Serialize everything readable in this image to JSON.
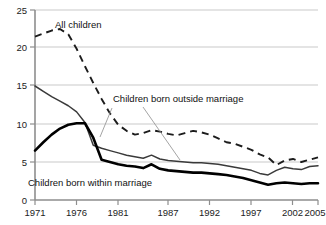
{
  "chart_data": {
    "type": "line",
    "title": "",
    "xlabel": "",
    "ylabel": "",
    "xlim": [
      1971,
      2005
    ],
    "ylim": [
      0,
      25
    ],
    "grid": true,
    "legend_position": "inline-annotations",
    "y_ticks": [
      "0",
      "5",
      "10",
      "15",
      "20",
      "25"
    ],
    "y_tick_values": [
      0,
      5,
      10,
      15,
      20,
      25
    ],
    "x_ticks": [
      "1971",
      "1976",
      "1981",
      "1987",
      "1992",
      "1997",
      "2002",
      "2005"
    ],
    "x_tick_values": [
      1971,
      1976,
      1981,
      1987,
      1992,
      1997,
      2002,
      2005
    ],
    "x": [
      1971,
      1972,
      1973,
      1974,
      1975,
      1976,
      1977,
      1978,
      1979,
      1980,
      1981,
      1982,
      1983,
      1984,
      1985,
      1986,
      1987,
      1988,
      1989,
      1990,
      1991,
      1992,
      1993,
      1994,
      1995,
      1996,
      1997,
      1998,
      1999,
      2000,
      2001,
      2002,
      2003,
      2004,
      2005
    ],
    "series": [
      {
        "name": "All children",
        "style": "dashed",
        "color": "#1c1c1c",
        "values": [
          21.5,
          21.9,
          22.3,
          22.5,
          21.8,
          19.9,
          17.6,
          15.4,
          13.3,
          11.4,
          9.9,
          9.1,
          8.6,
          8.8,
          9.2,
          9.0,
          8.7,
          8.5,
          8.8,
          9.1,
          8.9,
          8.6,
          8.1,
          7.6,
          7.4,
          7.0,
          6.6,
          6.0,
          5.6,
          4.6,
          5.2,
          5.4,
          5.0,
          5.3,
          5.6
        ]
      },
      {
        "name": "Children born outside marriage",
        "style": "solid",
        "color": "#3a3a3a",
        "values": [
          15.0,
          14.3,
          13.6,
          13.0,
          12.4,
          11.6,
          10.2,
          7.2,
          6.8,
          6.5,
          6.2,
          5.9,
          5.7,
          5.5,
          5.9,
          5.4,
          5.2,
          5.1,
          5.0,
          4.9,
          4.9,
          4.8,
          4.7,
          4.5,
          4.3,
          4.1,
          3.9,
          3.5,
          3.3,
          3.9,
          4.3,
          4.1,
          4.0,
          4.4,
          4.5
        ]
      },
      {
        "name": "Children born within marriage",
        "style": "solid-thick",
        "color": "#000000",
        "values": [
          6.5,
          7.6,
          8.6,
          9.4,
          9.9,
          10.1,
          10.1,
          8.2,
          5.3,
          5.0,
          4.7,
          4.5,
          4.4,
          4.2,
          4.7,
          4.1,
          3.9,
          3.8,
          3.7,
          3.6,
          3.6,
          3.5,
          3.4,
          3.3,
          3.1,
          2.9,
          2.6,
          2.3,
          2.0,
          2.2,
          2.3,
          2.2,
          2.1,
          2.2,
          2.2
        ]
      }
    ],
    "annotations": [
      {
        "name": "all-children",
        "text": "All children",
        "x": 55,
        "y": 28
      },
      {
        "name": "children-outside-marriage",
        "text": "Children born outside marriage",
        "x": 113,
        "y": 102
      },
      {
        "name": "children-within-marriage",
        "text": "Children born within marriage",
        "x": 28,
        "y": 186
      }
    ]
  }
}
